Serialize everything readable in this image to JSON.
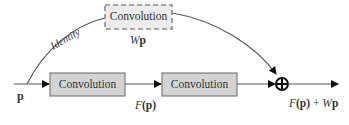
{
  "diagram": {
    "type": "residual-block",
    "input": {
      "label": "p"
    },
    "identity_branch": {
      "curve_label": "Identity",
      "box": {
        "label": "Convolution",
        "style": "dashed"
      },
      "output_label": "Wp",
      "output_label_parts": {
        "italic": "W",
        "bold": "p"
      }
    },
    "main_branch": {
      "boxes": [
        {
          "label": "Convolution"
        },
        {
          "label": "Convolution"
        }
      ],
      "intermediate_label": "F(p)",
      "intermediate_label_parts": {
        "italic": "F",
        "rest": "(p)"
      }
    },
    "merge": {
      "symbol": "⊕",
      "operation": "add"
    },
    "output": {
      "label": "F(p) + Wp",
      "label_parts": {
        "f_italic": "F",
        "f_rest": "(p)",
        "plus": " + ",
        "w_italic": "W",
        "w_bold": "p"
      }
    },
    "colors": {
      "box_fill": "#d3d3d3",
      "box_border": "#666666",
      "dashed_box_fill": "#ececec",
      "dashed_box_border": "#8a8a8a",
      "line": "#555555",
      "arrow": "#111111"
    }
  }
}
